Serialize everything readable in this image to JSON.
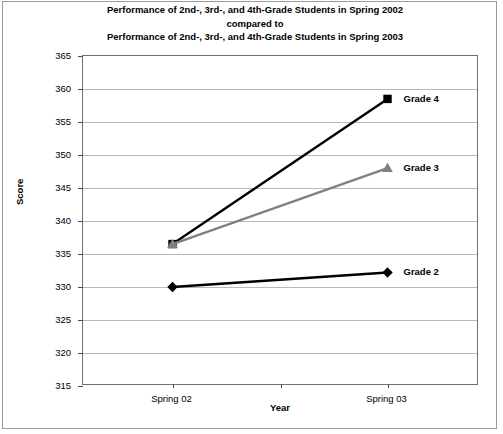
{
  "chart_data": {
    "type": "line",
    "title": "Performance of 2nd-, 3rd-, and 4th-Grade Students in Spring 2002 compared to Performance of 2nd-, 3rd-, and 4th-Grade Students in Spring 2003",
    "title_lines": [
      "Performance of 2nd-, 3rd-, and 4th-Grade Students in Spring 2002",
      "compared to",
      "Performance of 2nd-, 3rd-, and 4th-Grade Students in Spring 2003"
    ],
    "xlabel": "Year",
    "ylabel": "Score",
    "categories": [
      "Spring 02",
      "Spring 03"
    ],
    "ylim": [
      315,
      365
    ],
    "ytick_step": 5,
    "yticks": [
      315,
      320,
      325,
      330,
      335,
      340,
      345,
      350,
      355,
      360,
      365
    ],
    "grid": true,
    "legend_position": "right-of-endpoint",
    "series": [
      {
        "name": "Grade 4",
        "values": [
          336.5,
          358.5
        ],
        "color": "#000000",
        "marker": "square"
      },
      {
        "name": "Grade 3",
        "values": [
          336.5,
          348.0
        ],
        "color": "#808080",
        "marker": "triangle"
      },
      {
        "name": "Grade 2",
        "values": [
          330.0,
          332.2
        ],
        "color": "#000000",
        "marker": "diamond"
      }
    ]
  },
  "colors": {
    "grade4": "#000000",
    "grade3": "#808080",
    "grade2": "#000000",
    "gridline": "#b9b9b9",
    "axis": "#6f6f6f",
    "frame": "#9a9a9a",
    "background": "#ffffff"
  }
}
